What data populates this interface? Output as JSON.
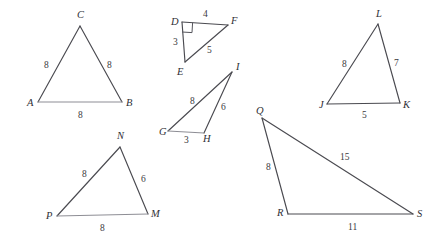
{
  "figure": {
    "background_color": "#ffffff",
    "stroke_color": "#4a4a50",
    "triangles": [
      {
        "id": "ABC",
        "vertices": [
          {
            "label": "A",
            "x": 38,
            "y": 102,
            "label_x": 27,
            "label_y": 106
          },
          {
            "label": "B",
            "x": 122,
            "y": 102,
            "label_x": 126,
            "label_y": 106
          },
          {
            "label": "C",
            "x": 80,
            "y": 26,
            "label_x": 77,
            "label_y": 18
          }
        ],
        "sides": [
          {
            "from": "A",
            "to": "C",
            "length": "8",
            "label_x": 44,
            "label_y": 68
          },
          {
            "from": "C",
            "to": "B",
            "length": "8",
            "label_x": 107,
            "label_y": 68
          },
          {
            "from": "A",
            "to": "B",
            "length": "8",
            "label_x": 78,
            "label_y": 118
          }
        ],
        "right_angle_at": null
      },
      {
        "id": "DEF",
        "vertices": [
          {
            "label": "D",
            "x": 182,
            "y": 22,
            "label_x": 171,
            "label_y": 25
          },
          {
            "label": "E",
            "x": 185,
            "y": 62,
            "label_x": 177,
            "label_y": 75
          },
          {
            "label": "F",
            "x": 228,
            "y": 25,
            "label_x": 231,
            "label_y": 24
          }
        ],
        "sides": [
          {
            "from": "D",
            "to": "F",
            "length": "4",
            "label_x": 203,
            "label_y": 17
          },
          {
            "from": "D",
            "to": "E",
            "length": "3",
            "label_x": 173,
            "label_y": 45
          },
          {
            "from": "E",
            "to": "F",
            "length": "5",
            "label_x": 207,
            "label_y": 53
          }
        ],
        "right_angle_at": "D"
      },
      {
        "id": "GHI",
        "vertices": [
          {
            "label": "G",
            "x": 168,
            "y": 131,
            "label_x": 159,
            "label_y": 135
          },
          {
            "label": "H",
            "x": 204,
            "y": 133,
            "label_x": 203,
            "label_y": 142
          },
          {
            "label": "I",
            "x": 232,
            "y": 72,
            "label_x": 236,
            "label_y": 70
          }
        ],
        "sides": [
          {
            "from": "G",
            "to": "I",
            "length": "8",
            "label_x": 190,
            "label_y": 104
          },
          {
            "from": "H",
            "to": "I",
            "length": "6",
            "label_x": 221,
            "label_y": 110
          },
          {
            "from": "G",
            "to": "H",
            "length": "3",
            "label_x": 184,
            "label_y": 143
          }
        ],
        "right_angle_at": null
      },
      {
        "id": "JKL",
        "vertices": [
          {
            "label": "J",
            "x": 327,
            "y": 104,
            "label_x": 319,
            "label_y": 108
          },
          {
            "label": "K",
            "x": 400,
            "y": 103,
            "label_x": 403,
            "label_y": 108
          },
          {
            "label": "L",
            "x": 378,
            "y": 24,
            "label_x": 376,
            "label_y": 17
          }
        ],
        "sides": [
          {
            "from": "J",
            "to": "L",
            "length": "8",
            "label_x": 342,
            "label_y": 67
          },
          {
            "from": "L",
            "to": "K",
            "length": "7",
            "label_x": 394,
            "label_y": 66
          },
          {
            "from": "J",
            "to": "K",
            "length": "5",
            "label_x": 362,
            "label_y": 118
          }
        ],
        "right_angle_at": null
      },
      {
        "id": "MNP",
        "vertices": [
          {
            "label": "N",
            "x": 120,
            "y": 147,
            "label_x": 117,
            "label_y": 139
          },
          {
            "label": "M",
            "x": 148,
            "y": 214,
            "label_x": 151,
            "label_y": 217
          },
          {
            "label": "P",
            "x": 57,
            "y": 216,
            "label_x": 46,
            "label_y": 219
          }
        ],
        "sides": [
          {
            "from": "P",
            "to": "N",
            "length": "8",
            "label_x": 82,
            "label_y": 177
          },
          {
            "from": "N",
            "to": "M",
            "length": "6",
            "label_x": 141,
            "label_y": 182
          },
          {
            "from": "P",
            "to": "M",
            "length": "8",
            "label_x": 100,
            "label_y": 231
          }
        ],
        "right_angle_at": null
      },
      {
        "id": "QRS",
        "vertices": [
          {
            "label": "Q",
            "x": 262,
            "y": 118,
            "label_x": 256,
            "label_y": 114
          },
          {
            "label": "R",
            "x": 288,
            "y": 214,
            "label_x": 277,
            "label_y": 216
          },
          {
            "label": "S",
            "x": 413,
            "y": 214,
            "label_x": 417,
            "label_y": 217
          }
        ],
        "sides": [
          {
            "from": "Q",
            "to": "R",
            "length": "8",
            "label_x": 266,
            "label_y": 170
          },
          {
            "from": "Q",
            "to": "S",
            "length": "15",
            "label_x": 340,
            "label_y": 160
          },
          {
            "from": "R",
            "to": "S",
            "length": "11",
            "label_x": 348,
            "label_y": 230
          }
        ],
        "right_angle_at": null
      }
    ]
  }
}
